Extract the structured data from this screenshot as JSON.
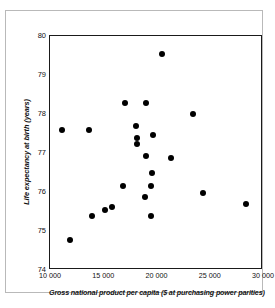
{
  "chart_data": {
    "type": "scatter",
    "title": "",
    "xlabel": "Gross national product per capita ($ at purchasing power parities)",
    "ylabel": "Life expectancy at birth (years)",
    "xlim": [
      10000,
      30000
    ],
    "ylim": [
      74,
      80
    ],
    "grid": false,
    "legend": null,
    "xticks": [
      10000,
      15000,
      20000,
      25000,
      30000
    ],
    "xtick_labels": [
      "10 000",
      "15 000",
      "20 000",
      "25 000",
      "30 000"
    ],
    "yticks": [
      74,
      75,
      76,
      77,
      78,
      79,
      80
    ],
    "ytick_labels": [
      "74",
      "75",
      "76",
      "77",
      "78",
      "79",
      "80"
    ],
    "marker": "filled-circle",
    "marker_color": "#000000",
    "points": [
      {
        "x": 20500,
        "y": 79.55
      },
      {
        "x": 17000,
        "y": 78.28
      },
      {
        "x": 19000,
        "y": 78.28
      },
      {
        "x": 23400,
        "y": 78.0
      },
      {
        "x": 18050,
        "y": 77.68
      },
      {
        "x": 11100,
        "y": 77.6
      },
      {
        "x": 13700,
        "y": 77.6
      },
      {
        "x": 19700,
        "y": 77.45
      },
      {
        "x": 18200,
        "y": 77.38
      },
      {
        "x": 18200,
        "y": 77.22
      },
      {
        "x": 19000,
        "y": 76.92
      },
      {
        "x": 21400,
        "y": 76.88
      },
      {
        "x": 19600,
        "y": 76.5
      },
      {
        "x": 16900,
        "y": 76.16
      },
      {
        "x": 19500,
        "y": 76.15
      },
      {
        "x": 24400,
        "y": 75.98
      },
      {
        "x": 18900,
        "y": 75.88
      },
      {
        "x": 28400,
        "y": 75.68
      },
      {
        "x": 15800,
        "y": 75.62
      },
      {
        "x": 15200,
        "y": 75.55
      },
      {
        "x": 13900,
        "y": 75.38
      },
      {
        "x": 19500,
        "y": 75.38
      },
      {
        "x": 11900,
        "y": 74.78
      }
    ]
  }
}
